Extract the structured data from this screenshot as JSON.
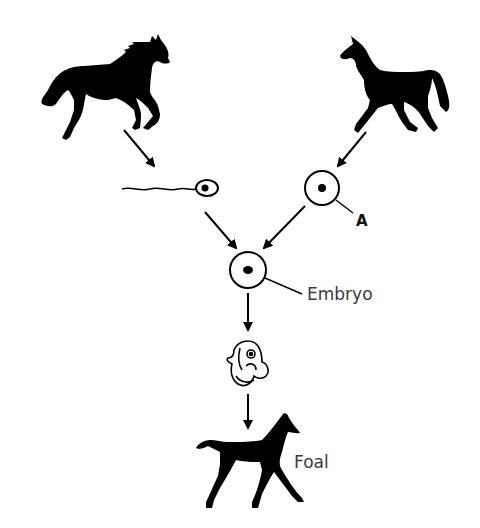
{
  "diagram": {
    "colors": {
      "ink": "#000000",
      "label": "#3a3a3a",
      "background": "#ffffff"
    },
    "nodes": [
      {
        "id": "stallion",
        "kind": "horse-silhouette",
        "label": ""
      },
      {
        "id": "mare",
        "kind": "horse-silhouette",
        "label": ""
      },
      {
        "id": "sperm",
        "kind": "sperm-cell",
        "label": ""
      },
      {
        "id": "egg",
        "kind": "egg-cell",
        "label": "A"
      },
      {
        "id": "embryo",
        "kind": "zygote-cell",
        "label": "Embryo"
      },
      {
        "id": "fetus",
        "kind": "fetus-drawing",
        "label": ""
      },
      {
        "id": "foal",
        "kind": "foal-silhouette",
        "label": "Foal"
      }
    ],
    "edges": [
      {
        "from": "stallion",
        "to": "sperm"
      },
      {
        "from": "mare",
        "to": "egg"
      },
      {
        "from": "sperm",
        "to": "embryo"
      },
      {
        "from": "egg",
        "to": "embryo"
      },
      {
        "from": "embryo",
        "to": "fetus"
      },
      {
        "from": "fetus",
        "to": "foal"
      }
    ]
  },
  "labels": {
    "a": "A",
    "embryo": "Embryo",
    "foal": "Foal"
  }
}
